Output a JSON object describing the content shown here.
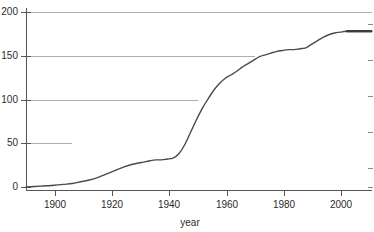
{
  "chart_data": {
    "type": "line",
    "title": "",
    "subtitle": "",
    "xlabel": "year",
    "ylabel": "",
    "xlim": [
      1890,
      2010
    ],
    "ylim": [
      0,
      200
    ],
    "grid": true,
    "legend": null,
    "x_ticks": [
      1900,
      1920,
      1940,
      1960,
      1980,
      2000
    ],
    "x_tick_labels": [
      "1900",
      "1920",
      "1940",
      "1960",
      "1980",
      "2000"
    ],
    "y_ticks": [
      0,
      50,
      100,
      150,
      200
    ],
    "y_tick_labels": [
      "0",
      "50",
      "100",
      "150",
      "200"
    ],
    "series": [
      {
        "name": "cumulative count",
        "color": "#4a4a4a",
        "x": [
          1890,
          1895,
          1900,
          1903,
          1906,
          1909,
          1912,
          1915,
          1918,
          1921,
          1924,
          1927,
          1930,
          1933,
          1935,
          1937,
          1939,
          1941,
          1943,
          1945,
          1947,
          1949,
          1951,
          1953,
          1955,
          1957,
          1959,
          1961,
          1963,
          1965,
          1967,
          1969,
          1971,
          1973,
          1975,
          1977,
          1979,
          1981,
          1983,
          1985,
          1987,
          1989,
          1991,
          1993,
          1995,
          1997,
          1999,
          2001,
          2003,
          2005,
          2007,
          2010
        ],
        "y": [
          0,
          1,
          2,
          3,
          4,
          6,
          8,
          11,
          15,
          19,
          23,
          26,
          28,
          30,
          31,
          31,
          32,
          33,
          38,
          48,
          62,
          76,
          89,
          100,
          110,
          118,
          124,
          128,
          132,
          137,
          141,
          145,
          149,
          151,
          153,
          155,
          156,
          157,
          157,
          158,
          159,
          163,
          167,
          171,
          174,
          176,
          177,
          178,
          178,
          178,
          178,
          178
        ]
      }
    ],
    "annotations": [],
    "final_value": 178
  },
  "axis": {
    "x_label": "year",
    "y_label": ""
  }
}
